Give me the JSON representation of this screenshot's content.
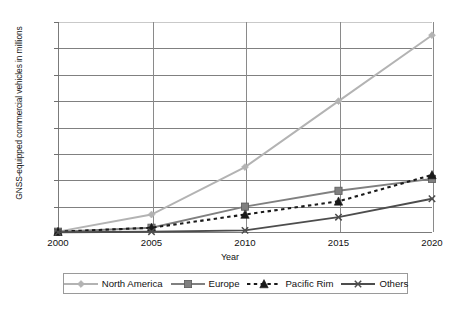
{
  "chart_data": {
    "type": "line",
    "title": "",
    "xlabel": "Year",
    "ylabel": "GNSS-equipped commercial vehicles in millions",
    "x": [
      2000,
      2005,
      2010,
      2015,
      2020
    ],
    "categories": [
      "2000",
      "2005",
      "2010",
      "2015",
      "2020"
    ],
    "xlim": [
      2000,
      2020
    ],
    "ylim": [
      0,
      80
    ],
    "yticks": [
      0,
      10,
      20,
      30,
      40,
      50,
      60,
      70,
      80
    ],
    "ytick_labels": [
      "0",
      "10",
      "20",
      "30",
      "40",
      "50",
      "60",
      "70",
      "80"
    ],
    "grid": "horizontal",
    "legend_position": "bottom",
    "series": [
      {
        "name": "North America",
        "values": [
          0.5,
          7,
          25,
          50,
          75
        ],
        "color": "#b3b3b3",
        "marker": "diamond",
        "dash": "solid"
      },
      {
        "name": "Europe",
        "values": [
          0.5,
          2,
          10,
          16,
          20.5
        ],
        "color": "#808080",
        "marker": "square",
        "dash": "solid"
      },
      {
        "name": "Pacific Rim",
        "values": [
          0.5,
          2,
          7,
          12,
          22
        ],
        "color": "#1a1a1a",
        "marker": "triangle",
        "dash": "dashed"
      },
      {
        "name": "Others",
        "values": [
          0.3,
          0.5,
          1,
          6,
          13
        ],
        "color": "#4d4d4d",
        "marker": "x",
        "dash": "solid"
      }
    ]
  }
}
